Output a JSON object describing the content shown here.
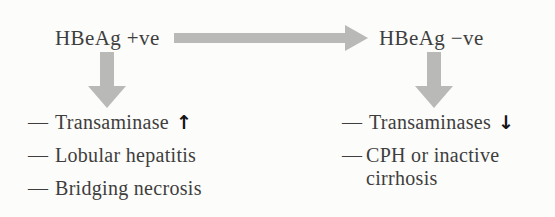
{
  "flow": {
    "left_node": "HBeAg +ve",
    "right_node": "HBeAg −ve",
    "left_items": [
      {
        "bullet": "—",
        "text": "Transaminase",
        "trend": "↑"
      },
      {
        "bullet": "—",
        "text": "Lobular hepatitis",
        "trend": ""
      },
      {
        "bullet": "—",
        "text": "Bridging necrosis",
        "trend": ""
      }
    ],
    "right_items": [
      {
        "bullet": "—",
        "text": "Transaminases",
        "trend": "↓"
      },
      {
        "bullet": "—",
        "text": "CPH or inactive cirrhosis",
        "trend": ""
      }
    ],
    "icons": {
      "horizontal_arrow": "right-arrow",
      "left_branch_arrow": "down-arrow",
      "right_branch_arrow": "down-arrow",
      "left_trend": "up-arrow",
      "right_trend": "down-arrow"
    },
    "colors": {
      "text": "#3e3e3e",
      "flow_arrow": "#b9b9b7",
      "trend_arrow": "#141414",
      "background": "#fcfcfa"
    }
  }
}
